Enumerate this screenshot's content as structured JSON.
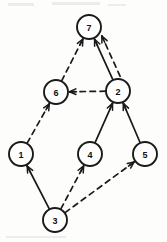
{
  "diagram": {
    "type": "directed-graph",
    "title": "",
    "width": 167,
    "height": 242,
    "background_color": "#fdfdfc",
    "stroke_color": "#1a1a1a",
    "node_radius": 12,
    "nodes": [
      {
        "id": "1",
        "label": "1",
        "x": 21,
        "y": 154
      },
      {
        "id": "2",
        "label": "2",
        "x": 118,
        "y": 91
      },
      {
        "id": "3",
        "label": "3",
        "x": 55,
        "y": 220
      },
      {
        "id": "4",
        "label": "4",
        "x": 90,
        "y": 154
      },
      {
        "id": "5",
        "label": "5",
        "x": 145,
        "y": 154
      },
      {
        "id": "6",
        "label": "6",
        "x": 56,
        "y": 92
      },
      {
        "id": "7",
        "label": "7",
        "x": 89,
        "y": 27
      }
    ],
    "edges": [
      {
        "from": "3",
        "to": "1",
        "style": "solid",
        "arrow": "to"
      },
      {
        "from": "3",
        "to": "4",
        "style": "dashed",
        "arrow": "to"
      },
      {
        "from": "3",
        "to": "5",
        "style": "dashed",
        "arrow": "to"
      },
      {
        "from": "4",
        "to": "2",
        "style": "solid",
        "arrow": "to"
      },
      {
        "from": "5",
        "to": "2",
        "style": "solid",
        "arrow": "to"
      },
      {
        "from": "1",
        "to": "6",
        "style": "dashed",
        "arrow": "to"
      },
      {
        "from": "2",
        "to": "6",
        "style": "dashed",
        "arrow": "to"
      },
      {
        "from": "6",
        "to": "7",
        "style": "dashed",
        "arrow": "to"
      },
      {
        "from": "2",
        "to": "7",
        "style": "solid",
        "arrow": "to"
      },
      {
        "from": "2",
        "to": "7",
        "style": "dashed",
        "arrow": "to",
        "offset": 8
      }
    ],
    "legend": [],
    "annotations": []
  }
}
